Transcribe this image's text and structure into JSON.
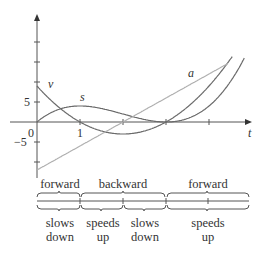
{
  "chart_data": {
    "type": "line",
    "title": "",
    "xlabel": "t",
    "ylabel": "",
    "x_ticks": [
      0,
      1,
      2,
      3,
      4
    ],
    "y_ticks_labeled": [
      5,
      -5
    ],
    "axis_labels": {
      "origin": "0",
      "x_one": "1",
      "y_five": "5",
      "y_neg_five": "−5",
      "t": "t"
    },
    "xlim": [
      0,
      4.6
    ],
    "ylim": [
      -13,
      26
    ],
    "grid": false,
    "series": [
      {
        "name": "s",
        "formula": "t^3 - 6t^2 + 9t",
        "x": [
          0,
          0.5,
          1,
          1.5,
          2,
          2.5,
          3,
          3.5,
          4,
          4.5
        ],
        "values": [
          0,
          3.1,
          4,
          3.4,
          2,
          0.6,
          0,
          0.9,
          4,
          10.1
        ]
      },
      {
        "name": "v",
        "formula": "3t^2 - 12t + 9",
        "x": [
          0,
          0.5,
          1,
          1.5,
          2,
          2.5,
          3,
          3.5,
          4,
          4.5
        ],
        "values": [
          9,
          3.75,
          0,
          -2.25,
          -3,
          -2.25,
          0,
          3.75,
          9,
          15.75
        ]
      },
      {
        "name": "a",
        "formula": "6t - 12",
        "x": [
          0,
          4.5
        ],
        "values": [
          -12,
          15
        ]
      }
    ],
    "motion_intervals": {
      "direction": [
        {
          "label": "forward",
          "from": 0,
          "to": 1
        },
        {
          "label": "backward",
          "from": 1,
          "to": 3
        },
        {
          "label": "forward",
          "from": 3,
          "to": 5
        }
      ],
      "speed": [
        {
          "label": "slows down",
          "from": 0,
          "to": 1
        },
        {
          "label": "speeds up",
          "from": 1,
          "to": 2
        },
        {
          "label": "slows down",
          "from": 2,
          "to": 3
        },
        {
          "label": "speeds up",
          "from": 3,
          "to": 5
        }
      ]
    }
  },
  "labels": {
    "dir1": "forward",
    "dir2": "backward",
    "dir3": "forward",
    "sp1a": "slows",
    "sp1b": "down",
    "sp2a": "speeds",
    "sp2b": "up",
    "sp3a": "slows",
    "sp3b": "down",
    "sp4a": "speeds",
    "sp4b": "up"
  }
}
